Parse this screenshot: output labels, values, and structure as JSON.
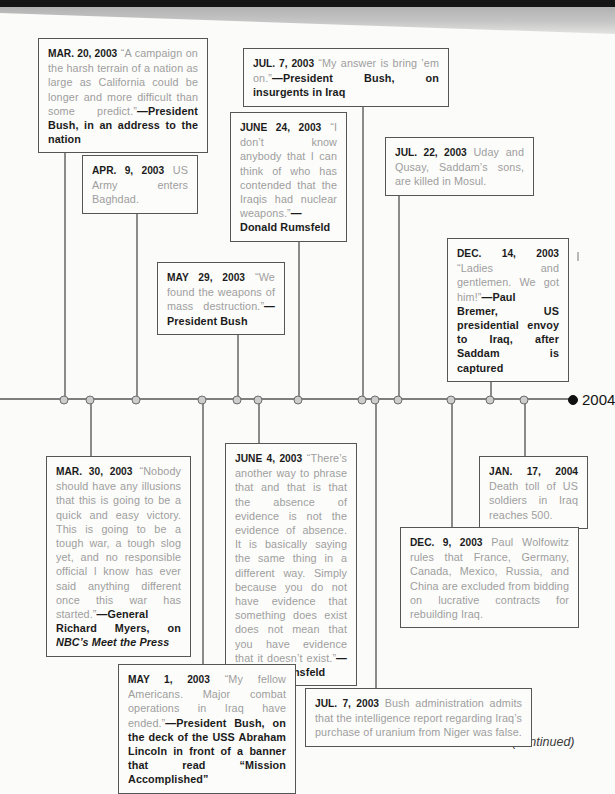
{
  "page": {
    "year_end_label": "2004",
    "continued_label": "(continued)",
    "colors": {
      "quote_text": "#9e9e9e",
      "emphasis_text": "#1b1b1b",
      "box_border": "#565656",
      "timeline_line": "#7e7e7e",
      "dot_fill": "#cdcdcd",
      "dot_border": "#6d6d6d",
      "end_dot": "#101010",
      "top_bar": "#151515"
    }
  },
  "events": [
    {
      "id": "mar-20-2003",
      "side": "above",
      "date": "MAR. 20, 2003",
      "quote": "“A campaign on the harsh terrain of a nation as large as California could be longer and more difficult than some predict.”",
      "attribution": "—President Bush, in an address to the nation"
    },
    {
      "id": "mar-30-2003",
      "side": "below",
      "date": "MAR. 30, 2003",
      "quote": "“Nobody should have any illusions that this is going to be a quick and easy victory. This is going to be a tough war, a tough slog yet, and no responsible official I know has ever said anything different once this war has started.”",
      "attribution": "—General Richard Myers, on ",
      "attribution_italic": "NBC’s Meet the Press"
    },
    {
      "id": "apr-9-2003",
      "side": "above",
      "date": "APR. 9, 2003",
      "text": "US Army enters Baghdad."
    },
    {
      "id": "may-1-2003",
      "side": "below",
      "date": "MAY 1, 2003",
      "quote": "“My fellow Americans. Major combat operations in Iraq have ended.”",
      "attribution": "—President Bush, on the deck of the USS Abraham Lincoln in front of a banner that read “Mission Accomplished”"
    },
    {
      "id": "may-29-2003",
      "side": "above",
      "date": "MAY 29, 2003",
      "quote": "“We found the weapons of mass destruction.”",
      "attribution": "—President Bush"
    },
    {
      "id": "june-4-2003",
      "side": "below",
      "date": "JUNE 4, 2003",
      "quote": "“There’s another way to phrase that and that is that the absence of evidence is not the evidence of absence. It is basically saying the same thing in a different way. Simply because you do not have evidence that something does exist does not mean that you have evidence that it doesn’t exist.”",
      "attribution": "—Donald Rumsfeld"
    },
    {
      "id": "june-24-2003",
      "side": "above",
      "date": "JUNE 24, 2003",
      "quote": "“I don’t know anybody that I can think of who has contended that the Iraqis had nuclear weapons.”",
      "attribution": "—Donald Rumsfeld"
    },
    {
      "id": "jul-7-2003-bring-em-on",
      "side": "above",
      "date": "JUL. 7, 2003",
      "quote": "“My answer is bring ’em on.”",
      "attribution": "—President Bush, on insurgents in Iraq"
    },
    {
      "id": "jul-7-2003-niger",
      "side": "below",
      "date": "JUL. 7, 2003",
      "text": "Bush administration admits that the intelligence report regarding Iraq’s purchase of uranium from Niger was false."
    },
    {
      "id": "jul-22-2003",
      "side": "above",
      "date": "JUL. 22, 2003",
      "text": "Uday and Qusay, Saddam’s sons, are killed in Mosul."
    },
    {
      "id": "dec-9-2003",
      "side": "below",
      "date": "DEC. 9, 2003",
      "text": "Paul Wolfowitz rules that France, Germany, Canada, Mexico, Russia, and China are excluded from bidding on lucrative contracts for rebuilding Iraq."
    },
    {
      "id": "dec-14-2003",
      "side": "above",
      "date": "DEC. 14, 2003",
      "quote": "“Ladies and gentlemen. We got him!”",
      "attribution": "—Paul Bremer, US presidential envoy to Iraq, after Saddam is captured"
    },
    {
      "id": "jan-17-2004",
      "side": "below",
      "date": "JAN. 17, 2004",
      "text": "Death toll of US soldiers in Iraq reaches 500."
    }
  ]
}
